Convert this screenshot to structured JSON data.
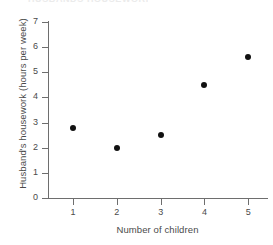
{
  "figure": {
    "title_remnant": "HUSBANDS HOUSEWORK",
    "background_color": "#ffffff",
    "axis_color": "#6e6e6e",
    "text_color": "#4a4a4a",
    "marker_color": "#111111"
  },
  "chart_data": {
    "type": "scatter",
    "title": "",
    "xlabel": "Number of children",
    "ylabel": "Husband's housework (hours per week)",
    "x": [
      1,
      2,
      3,
      4,
      5
    ],
    "values": [
      2.8,
      2.0,
      2.5,
      4.5,
      5.6
    ],
    "series": [
      {
        "name": "Husband's housework",
        "points": [
          {
            "x": 1,
            "y": 2.8
          },
          {
            "x": 2,
            "y": 2.0
          },
          {
            "x": 3,
            "y": 2.5
          },
          {
            "x": 4,
            "y": 4.5
          },
          {
            "x": 5,
            "y": 5.6
          }
        ]
      }
    ],
    "xlim": [
      0.45,
      5.45
    ],
    "ylim": [
      0,
      7
    ],
    "xticks": [
      1,
      2,
      3,
      4,
      5
    ],
    "xticklabels": [
      "1",
      "2",
      "3",
      "4",
      "5"
    ],
    "yticks": [
      0,
      1,
      2,
      3,
      4,
      5,
      6,
      7
    ],
    "yticklabels": [
      "0",
      "1",
      "2",
      "3",
      "4",
      "5",
      "6",
      "7"
    ],
    "grid": false,
    "legend": null,
    "marker": "filled-circle"
  }
}
